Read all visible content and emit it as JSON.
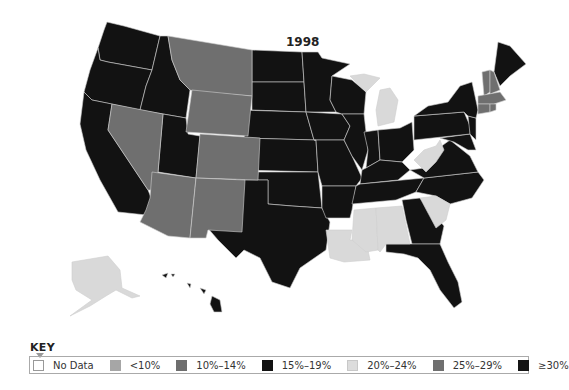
{
  "map": {
    "title": "1998",
    "colors": {
      "no_data": "#ffffff",
      "lt10": "#a6a6a6",
      "p10_14": "#6e6e6e",
      "p15_19": "#111111",
      "p20_24": "#d9d9d9",
      "p25_29": "#6f6f6f",
      "gte30": "#151515"
    },
    "states": {
      "WA": "15-19%",
      "OR": "15-19%",
      "CA": "15-19%",
      "ID": "15-19%",
      "NV": "25-29%",
      "MT": "25-29%",
      "WY": "25-29%",
      "UT": "15-19%",
      "AZ": "25-29%",
      "CO": "25-29%",
      "NM": "25-29%",
      "ND": "15-19%",
      "SD": "15-19%",
      "NE": "15-19%",
      "KS": "15-19%",
      "OK": "15-19%",
      "TX": "15-19%",
      "MN": "15-19%",
      "IA": "15-19%",
      "MO": "15-19%",
      "AR": "15-19%",
      "LA": "20-24%",
      "WI": "15-19%",
      "IL": "15-19%",
      "MI": "20-24%",
      "IN": "15-19%",
      "OH": "15-19%",
      "KY": "15-19%",
      "TN": "15-19%",
      "MS": "20-24%",
      "AL": "20-24%",
      "GA": "15-19%",
      "FL": "15-19%",
      "SC": "20-24%",
      "NC": "15-19%",
      "VA": "15-19%",
      "WV": "20-24%",
      "MD": "15-19%",
      "DE": "15-19%",
      "PA": "15-19%",
      "NJ": "15-19%",
      "NY": "15-19%",
      "CT": "25-29%",
      "RI": "25-29%",
      "MA": "25-29%",
      "VT": "25-29%",
      "NH": "25-29%",
      "ME": "15-19%",
      "AK": "20-24%",
      "HI": "15-19%"
    }
  },
  "key": {
    "title": "KEY",
    "items": [
      {
        "label": "No Data",
        "color": "#ffffff"
      },
      {
        "label": "<10%",
        "color": "#a6a6a6"
      },
      {
        "label": "10%–14%",
        "color": "#6e6e6e"
      },
      {
        "label": "15%–19%",
        "color": "#111111"
      },
      {
        "label": "20%–24%",
        "color": "#dcdcdc"
      },
      {
        "label": "25%–29%",
        "color": "#6f6f6f"
      },
      {
        "label": "≥30%",
        "color": "#151515"
      }
    ]
  }
}
